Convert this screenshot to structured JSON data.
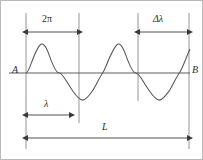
{
  "figure": {
    "type": "wave-diagram",
    "width": 203,
    "height": 160,
    "background_color": "#ffffff",
    "border_color": "#b9b9b9",
    "line_color": "#4a4a4a",
    "curve_color": "#555555",
    "text_color": "#2b2b2b"
  },
  "axis": {
    "label_left": "A",
    "label_right": "B",
    "y": 72,
    "x_start": 8,
    "x_end": 189
  },
  "guides": [
    {
      "name": "guide-left",
      "x": 25,
      "y_top": 12,
      "y_bottom": 148
    },
    {
      "name": "guide-lambda-end",
      "x": 78,
      "y_top": 12,
      "y_bottom": 122
    },
    {
      "name": "guide-delta-start",
      "x": 137,
      "y_top": 12,
      "y_bottom": 100
    },
    {
      "name": "guide-right",
      "x": 188,
      "y_top": 12,
      "y_bottom": 148
    }
  ],
  "dimensions": [
    {
      "name": "two-pi",
      "label": "2π",
      "x_start": 25,
      "x_end": 78,
      "y": 31
    },
    {
      "name": "delta-lambda",
      "label": "Δλ",
      "x_start": 137,
      "x_end": 188,
      "y": 31
    },
    {
      "name": "lambda",
      "label": "λ",
      "x_start": 25,
      "x_end": 70,
      "y": 114
    },
    {
      "name": "total-length",
      "label": "L",
      "x_start": 25,
      "x_end": 188,
      "y": 137
    }
  ],
  "wave": {
    "x_start": 25,
    "x_end": 189,
    "baseline_y": 72,
    "amplitude": 28,
    "wavelength": 53,
    "cycles": 3.1,
    "phase": "starts at zero rising"
  }
}
